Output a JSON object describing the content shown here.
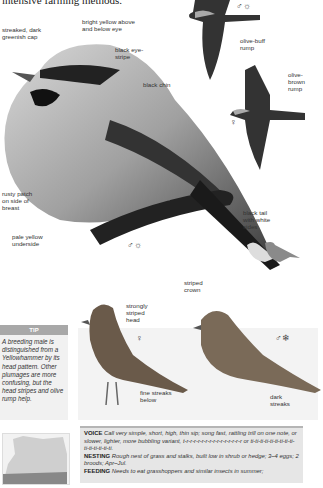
{
  "page": {
    "intro_text": "intensive farming methods."
  },
  "main_bird": {
    "labels": {
      "cap": "streaked, dark greenish cap",
      "eye": "bright yellow above and below eye",
      "eye_stripe": "black eye-stripe",
      "chin": "black chin",
      "rusty": "rusty patch on side of breast",
      "underside": "pale yellow underside",
      "tail": "black tail with white sides"
    },
    "sex_symbol": "♂☼"
  },
  "flight_birds": {
    "male": {
      "sex_symbol": "♂☼",
      "label": "olive-buff rump"
    },
    "female": {
      "sex_symbol": "♀",
      "label": "olive-brown rump"
    }
  },
  "female_bird": {
    "sex_symbol": "♀",
    "labels": {
      "head": "strongly striped head",
      "below": "fine streaks below"
    }
  },
  "winter_male": {
    "sex_symbol": "♂❄",
    "labels": {
      "crown": "striped crown",
      "streaks": "dark streaks"
    }
  },
  "tip": {
    "heading": "TIP",
    "body": "A breeding male is distinguished from a Yellowhammer by its head pattern. Other plumages are more confusing, but the head stripes and olive rump help."
  },
  "info": {
    "voice_label": "VOICE",
    "voice_text": "Call very simple, short, high, thin sip; song fast, rattling trill on one note, or slower, lighter, more bubbling variant, t-r-r-r-r-r-r-r-r-r-r-r-r-r-r-r or ti-ti-ti-ti-ti-ti-ti-ti-ti-ti-ti-ti-ti-ti-ti.",
    "nesting_label": "NESTING",
    "nesting_text": "Rough nest of grass and stalks, built low in shrub or hedge; 3–4 eggs; 2 broods; Apr–Jul.",
    "feeding_label": "FEEDING",
    "feeding_text": "Needs to eat grasshoppers and similar insects in summer;"
  },
  "colors": {
    "tip_header": "#a8a8a8",
    "tip_bg": "#f1f1f1",
    "info_bg": "#e6e6e6",
    "silhouette": "#8a8a8a"
  }
}
